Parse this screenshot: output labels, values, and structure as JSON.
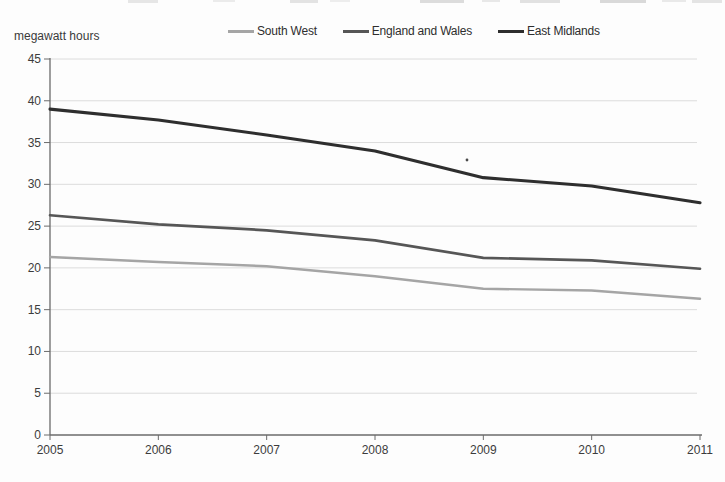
{
  "y_axis_title": "megawatt hours",
  "chart_data": {
    "type": "line",
    "title": "",
    "xlabel": "",
    "ylabel": "megawatt hours",
    "x": [
      2005,
      2006,
      2007,
      2008,
      2009,
      2010,
      2011
    ],
    "ylim": [
      0,
      45
    ],
    "yticks": [
      0,
      5,
      10,
      15,
      20,
      25,
      30,
      35,
      40,
      45
    ],
    "grid": true,
    "legend_position": "top-center",
    "series": [
      {
        "name": "South West",
        "color": "#a5a5a5",
        "values": [
          21.3,
          20.7,
          20.2,
          19.0,
          17.5,
          17.3,
          16.3
        ]
      },
      {
        "name": "England and Wales",
        "color": "#565656",
        "values": [
          26.3,
          25.2,
          24.5,
          23.3,
          21.2,
          20.9,
          19.9
        ]
      },
      {
        "name": "East Midlands",
        "color": "#2e2e2e",
        "values": [
          39.0,
          37.7,
          35.9,
          34.0,
          30.8,
          29.8,
          27.8
        ]
      }
    ],
    "colors": {
      "axis": "#6b6b6b",
      "grid": "#dcdcdc",
      "tick_label": "#3c3c3c"
    }
  }
}
